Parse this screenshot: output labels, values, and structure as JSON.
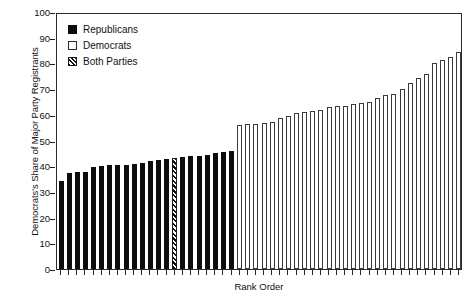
{
  "chart_data": {
    "type": "bar",
    "title": "",
    "xlabel": "Rank Order",
    "ylabel": "Democrats's Share of Major Party Registrants",
    "ylim": [
      0,
      100
    ],
    "yticks": [
      0,
      10,
      20,
      30,
      40,
      50,
      60,
      70,
      80,
      90,
      100
    ],
    "grid": false,
    "legend_position": "upper-left",
    "legend": [
      {
        "label": "Republicans",
        "swatch": "filled-black-square"
      },
      {
        "label": "Democrats",
        "swatch": "open-white-square"
      },
      {
        "label": "Both Parties",
        "swatch": "hatched-square"
      }
    ],
    "categories": [
      "1",
      "2",
      "3",
      "4",
      "5",
      "6",
      "7",
      "8",
      "9",
      "10",
      "11",
      "12",
      "13",
      "14",
      "15",
      "16",
      "17",
      "18",
      "19",
      "20",
      "21",
      "22",
      "23",
      "24",
      "25",
      "26",
      "27",
      "28",
      "29",
      "30",
      "31",
      "32",
      "33",
      "34",
      "35",
      "36",
      "37",
      "38",
      "39",
      "40",
      "41",
      "42",
      "43",
      "44",
      "45",
      "46",
      "47",
      "48",
      "49",
      "50"
    ],
    "values": [
      34.2,
      37.5,
      37.6,
      37.8,
      39.7,
      40.2,
      40.3,
      40.4,
      40.6,
      40.7,
      41.3,
      42.0,
      42.5,
      43.0,
      43.1,
      43.6,
      44.0,
      44.1,
      44.2,
      45.0,
      45.7,
      46.1,
      56.0,
      56.4,
      56.6,
      57.0,
      57.2,
      58.7,
      59.5,
      60.7,
      61.2,
      61.5,
      62.0,
      63.0,
      63.4,
      63.6,
      64.4,
      64.6,
      65.0,
      66.7,
      67.7,
      68.0,
      70.0,
      72.5,
      74.5,
      76.0,
      80.0,
      81.5,
      82.5,
      84.5
    ],
    "party": [
      "rep",
      "rep",
      "rep",
      "rep",
      "rep",
      "rep",
      "rep",
      "rep",
      "rep",
      "rep",
      "rep",
      "rep",
      "rep",
      "rep",
      "both",
      "rep",
      "rep",
      "rep",
      "rep",
      "rep",
      "rep",
      "rep",
      "dem",
      "dem",
      "dem",
      "dem",
      "dem",
      "dem",
      "dem",
      "dem",
      "dem",
      "dem",
      "dem",
      "dem",
      "dem",
      "dem",
      "dem",
      "dem",
      "dem",
      "dem",
      "dem",
      "dem",
      "dem",
      "dem",
      "dem",
      "dem",
      "dem",
      "dem",
      "dem",
      "dem"
    ]
  }
}
